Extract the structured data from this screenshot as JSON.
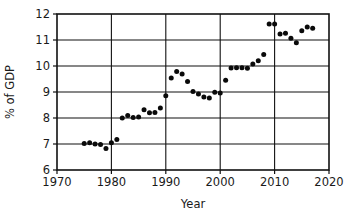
{
  "chart_data": {
    "type": "scatter",
    "title": "",
    "xlabel": "Year",
    "ylabel": "% of GDP",
    "xlim": [
      1970,
      2020
    ],
    "ylim": [
      6,
      12
    ],
    "xticks": [
      1970,
      1980,
      1990,
      2000,
      2010,
      2020
    ],
    "xtick_labels": [
      "1970",
      "1980",
      "1990",
      "2000",
      "2010",
      "2020"
    ],
    "yticks": [
      6,
      7,
      8,
      9,
      10,
      11,
      12
    ],
    "ytick_labels": [
      "6",
      "7",
      "8",
      "9",
      "10",
      "11",
      "12"
    ],
    "grid": "both",
    "grid_x_values": [
      1980,
      1990,
      2000,
      2010
    ],
    "grid_y_values": [
      7,
      8,
      9,
      10,
      11
    ],
    "legend": "none",
    "marker": "filled-circle",
    "marker_color": "#0a0a0a",
    "x": [
      1975,
      1976,
      1977,
      1978,
      1979,
      1980,
      1981,
      1982,
      1983,
      1984,
      1985,
      1986,
      1987,
      1988,
      1989,
      1990,
      1991,
      1992,
      1993,
      1994,
      1995,
      1996,
      1997,
      1998,
      1999,
      2000,
      2001,
      2002,
      2003,
      2004,
      2005,
      2006,
      2007,
      2008,
      2009,
      2010,
      2011,
      2012,
      2013,
      2014,
      2015,
      2016,
      2017
    ],
    "y": [
      7.02,
      7.05,
      7.0,
      6.98,
      6.83,
      7.05,
      7.17,
      8.0,
      8.1,
      8.02,
      8.04,
      8.32,
      8.2,
      8.21,
      8.38,
      8.86,
      9.54,
      9.79,
      9.69,
      9.4,
      9.02,
      8.92,
      8.81,
      8.77,
      8.99,
      8.96,
      9.45,
      9.92,
      9.93,
      9.93,
      9.91,
      10.08,
      10.2,
      10.44,
      11.62,
      11.62,
      11.23,
      11.26,
      11.07,
      10.89,
      11.36,
      11.5,
      11.45
    ],
    "series_name": "Health spending share of GDP"
  },
  "figure": {
    "plot_area": {
      "left": 57,
      "top": 14,
      "right": 329,
      "bottom": 170
    },
    "background": "#ffffff",
    "axis_color": "#111111"
  }
}
